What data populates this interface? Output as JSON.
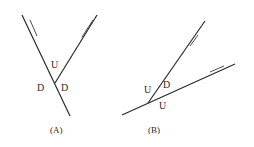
{
  "panels": [
    {
      "caption": "(A)",
      "labels": {
        "upper": "U",
        "lower_left": "D",
        "lower_right": "D"
      }
    },
    {
      "caption": "(B)",
      "labels": {
        "left": "U",
        "between": "D",
        "bottom": "U"
      }
    }
  ],
  "colors": {
    "line": "#2a2a2a",
    "background": "#ffffff"
  }
}
